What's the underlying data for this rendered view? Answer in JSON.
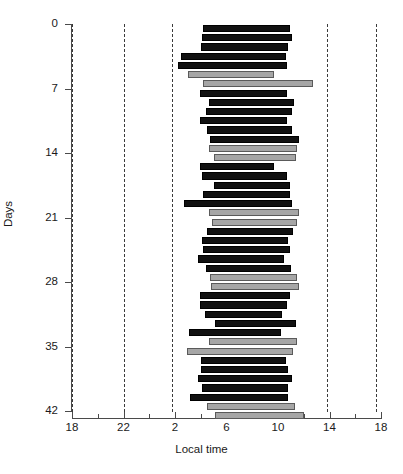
{
  "chart_data": {
    "type": "bar",
    "orientation": "horizontal",
    "title": "",
    "xlabel": "Local time",
    "ylabel": "Days",
    "xlim": [
      18,
      42
    ],
    "ylim": [
      0,
      42
    ],
    "grid": false,
    "legend": null,
    "x_tick_labels": [
      "18",
      "22",
      "2",
      "6",
      "10",
      "14",
      "18"
    ],
    "x_tick_values": [
      18,
      22,
      26,
      30,
      34,
      38,
      42
    ],
    "x_minor_tick_values": [
      20,
      24,
      28,
      32,
      36,
      40
    ],
    "y_tick_labels": [
      "0",
      "7",
      "14",
      "21",
      "28",
      "35",
      "42"
    ],
    "y_tick_values": [
      0,
      7,
      14,
      21,
      28,
      35,
      42
    ],
    "reference_lines": {
      "style": "dashed",
      "values": [
        18,
        22,
        25.8,
        37.8,
        41.6
      ]
    },
    "series": [
      {
        "name": "dark-bar",
        "color": "#111111"
      },
      {
        "name": "light-bar",
        "color": "#a6a6a6"
      }
    ],
    "bars": [
      {
        "day": 0,
        "start": 28.2,
        "end": 34.9,
        "color": "dark"
      },
      {
        "day": 1,
        "start": 28.1,
        "end": 35.1,
        "color": "dark"
      },
      {
        "day": 2,
        "start": 28.0,
        "end": 34.8,
        "color": "dark"
      },
      {
        "day": 3,
        "start": 26.5,
        "end": 34.6,
        "color": "dark"
      },
      {
        "day": 4,
        "start": 26.2,
        "end": 34.7,
        "color": "dark"
      },
      {
        "day": 5,
        "start": 27.0,
        "end": 33.7,
        "color": "light"
      },
      {
        "day": 6,
        "start": 28.2,
        "end": 36.7,
        "color": "light"
      },
      {
        "day": 7,
        "start": 27.9,
        "end": 34.7,
        "color": "dark"
      },
      {
        "day": 8,
        "start": 28.6,
        "end": 35.2,
        "color": "dark"
      },
      {
        "day": 9,
        "start": 28.4,
        "end": 35.1,
        "color": "dark"
      },
      {
        "day": 10,
        "start": 27.9,
        "end": 34.7,
        "color": "dark"
      },
      {
        "day": 11,
        "start": 28.5,
        "end": 35.1,
        "color": "dark"
      },
      {
        "day": 12,
        "start": 28.7,
        "end": 35.6,
        "color": "dark"
      },
      {
        "day": 13,
        "start": 28.6,
        "end": 35.5,
        "color": "light"
      },
      {
        "day": 14,
        "start": 29.0,
        "end": 35.4,
        "color": "light"
      },
      {
        "day": 15,
        "start": 27.9,
        "end": 33.7,
        "color": "dark"
      },
      {
        "day": 16,
        "start": 28.1,
        "end": 34.7,
        "color": "dark"
      },
      {
        "day": 17,
        "start": 29.0,
        "end": 34.9,
        "color": "dark"
      },
      {
        "day": 18,
        "start": 28.2,
        "end": 34.9,
        "color": "dark"
      },
      {
        "day": 19,
        "start": 26.7,
        "end": 35.1,
        "color": "dark"
      },
      {
        "day": 20,
        "start": 28.6,
        "end": 35.6,
        "color": "light"
      },
      {
        "day": 21,
        "start": 28.9,
        "end": 35.5,
        "color": "light"
      },
      {
        "day": 22,
        "start": 28.5,
        "end": 35.2,
        "color": "dark"
      },
      {
        "day": 23,
        "start": 28.1,
        "end": 34.8,
        "color": "dark"
      },
      {
        "day": 24,
        "start": 28.2,
        "end": 34.9,
        "color": "dark"
      },
      {
        "day": 25,
        "start": 27.8,
        "end": 34.5,
        "color": "dark"
      },
      {
        "day": 26,
        "start": 28.4,
        "end": 35.0,
        "color": "dark"
      },
      {
        "day": 27,
        "start": 28.7,
        "end": 35.5,
        "color": "light"
      },
      {
        "day": 28,
        "start": 28.8,
        "end": 35.6,
        "color": "light"
      },
      {
        "day": 29,
        "start": 27.9,
        "end": 34.9,
        "color": "dark"
      },
      {
        "day": 30,
        "start": 27.9,
        "end": 34.7,
        "color": "dark"
      },
      {
        "day": 31,
        "start": 28.3,
        "end": 34.3,
        "color": "dark"
      },
      {
        "day": 32,
        "start": 29.1,
        "end": 35.4,
        "color": "dark"
      },
      {
        "day": 33,
        "start": 27.1,
        "end": 34.2,
        "color": "dark"
      },
      {
        "day": 34,
        "start": 28.6,
        "end": 35.5,
        "color": "light"
      },
      {
        "day": 35,
        "start": 26.9,
        "end": 35.2,
        "color": "light"
      },
      {
        "day": 36,
        "start": 28.0,
        "end": 34.6,
        "color": "dark"
      },
      {
        "day": 37,
        "start": 28.0,
        "end": 34.8,
        "color": "dark"
      },
      {
        "day": 38,
        "start": 27.8,
        "end": 35.1,
        "color": "dark"
      },
      {
        "day": 39,
        "start": 28.1,
        "end": 34.8,
        "color": "dark"
      },
      {
        "day": 40,
        "start": 27.2,
        "end": 34.8,
        "color": "dark"
      },
      {
        "day": 41,
        "start": 28.5,
        "end": 35.3,
        "color": "light"
      },
      {
        "day": 42,
        "start": 29.1,
        "end": 36.0,
        "color": "light"
      }
    ]
  },
  "axes": {
    "x_title": "Local time",
    "y_title": "Days"
  },
  "colors": {
    "dark_bar": "#111111",
    "light_bar": "#a6a6a6",
    "light_bar_border": "#5a5a5a",
    "axis": "#4a4a4a",
    "dashed_line": "#3b3b3b",
    "background": "#ffffff"
  }
}
